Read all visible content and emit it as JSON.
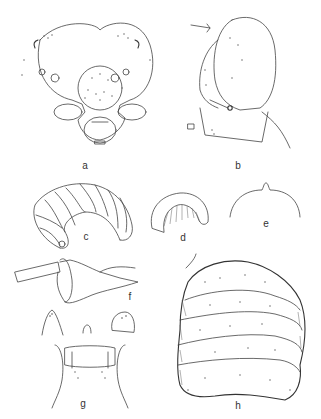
{
  "plate": {
    "description": "Scientific illustration plate of a larva (line drawings)",
    "figures": [
      {
        "id": "a",
        "label": "a",
        "subject": "head capsule, frontal view"
      },
      {
        "id": "b",
        "label": "b",
        "subject": "head capsule, lateral view"
      },
      {
        "id": "c",
        "label": "c",
        "subject": "larva habitus, lateral view"
      },
      {
        "id": "d",
        "label": "d",
        "subject": "larva habitus, contracted"
      },
      {
        "id": "e",
        "label": "e",
        "subject": "outline detail"
      },
      {
        "id": "f",
        "label": "f",
        "subject": "appendage / structure detail"
      },
      {
        "id": "g",
        "label": "g",
        "subject": "mouthparts, ventral view with details"
      },
      {
        "id": "h",
        "label": "h",
        "subject": "abdominal segments, detailed stippled view"
      }
    ]
  },
  "colors": {
    "background": "#ffffff",
    "line": "#444444",
    "label": "#333333"
  }
}
